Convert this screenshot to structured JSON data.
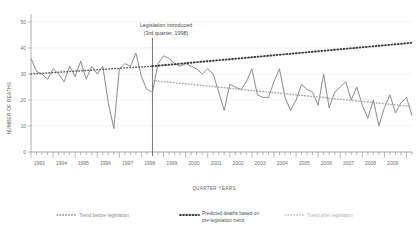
{
  "chart_data": {
    "type": "line",
    "title": "",
    "xlabel": "QUARTER YEARS",
    "ylabel": "NUMBER OF DEATHS",
    "ylim": [
      0,
      50
    ],
    "yticks": [
      0,
      10,
      20,
      30,
      40,
      50
    ],
    "grid": true,
    "legend_position": "bottom",
    "x_start_year": 1993,
    "x_end_year": 2009,
    "x_tick_years": [
      1993,
      1994,
      1995,
      1996,
      1997,
      1998,
      1999,
      2000,
      2001,
      2002,
      2003,
      2004,
      2005,
      2006,
      2007,
      2008,
      2009
    ],
    "quarters_per_year": 4,
    "annotation": {
      "line1": "Legislation introduced",
      "line2": "(3rd quarter, 1998)",
      "event_year": 1998,
      "event_quarter": 3
    },
    "series": [
      {
        "name": "Observed deaths",
        "type": "line",
        "values": [
          36,
          31,
          30,
          28,
          32,
          30,
          27,
          33,
          29,
          35,
          28,
          33,
          30,
          33,
          19,
          9,
          32,
          34,
          33,
          38,
          29,
          24,
          23,
          34,
          37,
          36,
          34,
          33,
          34,
          33,
          32,
          30,
          32,
          30,
          23,
          16,
          26,
          25,
          24,
          27,
          32,
          22,
          21,
          21,
          27,
          32,
          21,
          16,
          20,
          26,
          24,
          23,
          18,
          30,
          17,
          23,
          25,
          27,
          20,
          25,
          18,
          13,
          20,
          10,
          17,
          22,
          15,
          19,
          21,
          14
        ]
      },
      {
        "name": "Trend before legislation",
        "type": "trend",
        "style": "dotted-dark-thin",
        "start_value": 30.0,
        "end_value": 33.0,
        "span": "1993 Q1 - 1998 Q3"
      },
      {
        "name": "Predicted deaths based on pre-legislation trend",
        "type": "trend",
        "style": "dotted-black-thick",
        "start_value": 33.0,
        "end_value": 42.0,
        "span": "1998 Q3 - 2009 Q4"
      },
      {
        "name": "Trend after legislation",
        "type": "trend",
        "style": "dotted-grey",
        "start_value": 27.5,
        "end_value": 17.5,
        "span": "1998 Q3 - 2009 Q4"
      }
    ]
  },
  "legend": {
    "items": [
      {
        "label": "Trend before legislation",
        "color": "#8e8e8e"
      },
      {
        "label": "Predicted deaths based on",
        "label2": "pre-legislation trend",
        "color": "#3f3f3f"
      },
      {
        "label": "Trend after legislation",
        "color": "#c2c2c2"
      }
    ]
  }
}
